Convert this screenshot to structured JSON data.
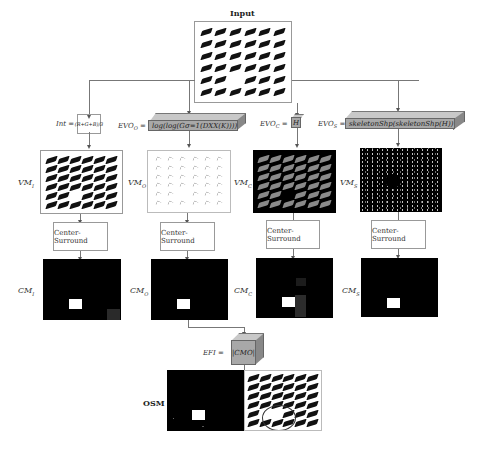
{
  "diagram": {
    "input": {
      "title": "Input"
    },
    "branches": [
      {
        "id": "I",
        "operator_label": "Int =",
        "operator_formula": "(R+G+B)/3",
        "vm_label": "VM_I",
        "vm_label_text": "VMI",
        "center_surround": "Center-Surround",
        "cm_label": "CM_I",
        "cm_label_text": "CMI"
      },
      {
        "id": "O",
        "operator_label": "EVO_O =",
        "operator_formula": "log(log(G_{σ=1}(D_{XX}(K))))",
        "operator_formula_text": "log(log(Gσ=1(DXX(K))))",
        "vm_label": "VM_O",
        "vm_label_text": "VMO",
        "center_surround": "Center-Surround",
        "cm_label": "CM_O",
        "cm_label_text": "CMO"
      },
      {
        "id": "C",
        "operator_label": "EVO_C =",
        "operator_label_text": "EVOC =",
        "operator_formula": "H",
        "vm_label": "VM_C",
        "vm_label_text": "VMC",
        "center_surround": "Center-Surround",
        "cm_label": "CM_C",
        "cm_label_text": "CMC"
      },
      {
        "id": "S",
        "operator_label": "EVO_S =",
        "operator_label_text": "EVOS =",
        "operator_formula": "skeletonShp(skeletonShp(H))",
        "vm_label": "VM_S",
        "vm_label_text": "VMS",
        "center_surround": "Center-Surround",
        "cm_label": "CM_S",
        "cm_label_text": "CMS"
      }
    ],
    "fusion": {
      "label": "EFI =",
      "formula": "|CM_O|",
      "formula_text": "|CMO|"
    },
    "output": {
      "label": "OSM"
    },
    "colors": {
      "line": "#777777",
      "slab": "#a8a8a8",
      "panel_dark": "#000000",
      "highlight": "#ffffff"
    }
  }
}
